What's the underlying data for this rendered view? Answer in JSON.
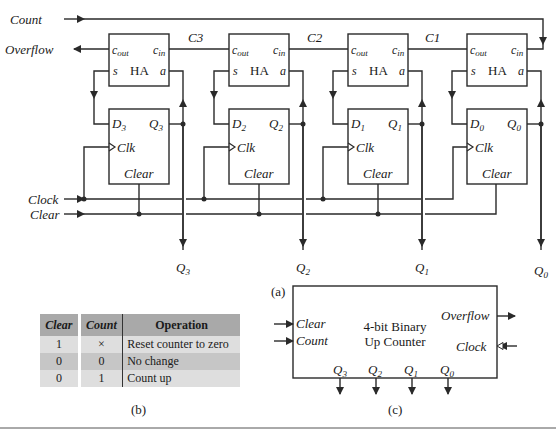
{
  "figure_a": {
    "label": "(a)",
    "inputs": {
      "count": "Count",
      "clock": "Clock",
      "clear": "Clear"
    },
    "outputs": {
      "overflow": "Overflow"
    },
    "carries": [
      "C3",
      "C2",
      "C1"
    ],
    "half_adders": [
      {
        "name": "HA",
        "cout": "c",
        "cout_sub": "out",
        "cin": "c",
        "cin_sub": "in",
        "s": "s",
        "a": "a"
      },
      {
        "name": "HA",
        "cout": "c",
        "cout_sub": "out",
        "cin": "c",
        "cin_sub": "in",
        "s": "s",
        "a": "a"
      },
      {
        "name": "HA",
        "cout": "c",
        "cout_sub": "out",
        "cin": "c",
        "cin_sub": "in",
        "s": "s",
        "a": "a"
      },
      {
        "name": "HA",
        "cout": "c",
        "cout_sub": "out",
        "cin": "c",
        "cin_sub": "in",
        "s": "s",
        "a": "a"
      }
    ],
    "flip_flops": [
      {
        "d": "D",
        "q": "Q",
        "index": "3",
        "clk": "Clk",
        "clear": "Clear"
      },
      {
        "d": "D",
        "q": "Q",
        "index": "2",
        "clk": "Clk",
        "clear": "Clear"
      },
      {
        "d": "D",
        "q": "Q",
        "index": "1",
        "clk": "Clk",
        "clear": "Clear"
      },
      {
        "d": "D",
        "q": "Q",
        "index": "0",
        "clk": "Clk",
        "clear": "Clear"
      }
    ],
    "q_outputs": [
      {
        "q": "Q",
        "index": "3"
      },
      {
        "q": "Q",
        "index": "2"
      },
      {
        "q": "Q",
        "index": "1"
      },
      {
        "q": "Q",
        "index": "0"
      }
    ]
  },
  "figure_b": {
    "label": "(b)",
    "headers": [
      "Clear",
      "Count",
      "Operation"
    ],
    "rows": [
      [
        "1",
        "×",
        "Reset counter to zero"
      ],
      [
        "0",
        "0",
        "No change"
      ],
      [
        "0",
        "1",
        "Count up"
      ]
    ]
  },
  "figure_c": {
    "label": "(c)",
    "title_line1": "4-bit Binary",
    "title_line2": "Up Counter",
    "inputs": {
      "clear": "Clear",
      "count": "Count",
      "clock": "Clock"
    },
    "outputs": {
      "overflow": "Overflow"
    },
    "q_outputs": [
      {
        "q": "Q",
        "index": "3"
      },
      {
        "q": "Q",
        "index": "2"
      },
      {
        "q": "Q",
        "index": "1"
      },
      {
        "q": "Q",
        "index": "0"
      }
    ]
  }
}
